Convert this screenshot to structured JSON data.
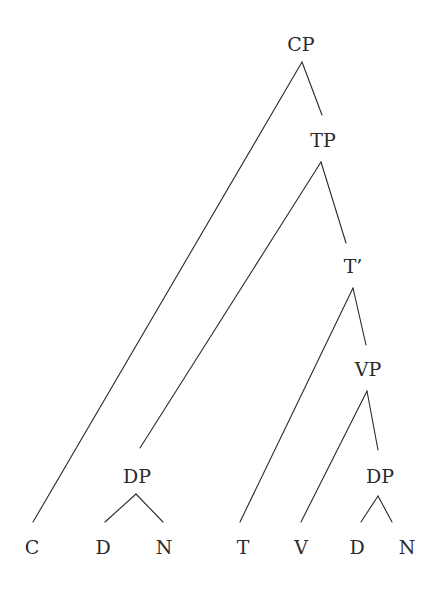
{
  "diagram": {
    "type": "syntax-tree",
    "nodes": {
      "cp": {
        "label": "CP",
        "x": 301,
        "y": 50
      },
      "tp": {
        "label": "TP",
        "x": 323,
        "y": 146
      },
      "tbar": {
        "label": "T’",
        "x": 353,
        "y": 272
      },
      "vp": {
        "label": "VP",
        "x": 368,
        "y": 375
      },
      "dp_subject": {
        "label": "DP",
        "x": 137,
        "y": 482
      },
      "dp_object": {
        "label": "DP",
        "x": 380,
        "y": 482
      },
      "c": {
        "label": "C",
        "x": 32,
        "y": 553
      },
      "d_subject": {
        "label": "D",
        "x": 103,
        "y": 553
      },
      "n_subject": {
        "label": "N",
        "x": 164,
        "y": 553
      },
      "t": {
        "label": "T",
        "x": 243,
        "y": 553
      },
      "v": {
        "label": "V",
        "x": 301,
        "y": 553
      },
      "d_object": {
        "label": "D",
        "x": 357,
        "y": 553
      },
      "n_object": {
        "label": "N",
        "x": 407,
        "y": 553
      }
    },
    "edges": [
      {
        "from": "cp",
        "to": "c",
        "x1": 302,
        "y1": 62,
        "x2": 33,
        "y2": 522
      },
      {
        "from": "cp",
        "to": "tp",
        "x1": 302,
        "y1": 62,
        "x2": 322,
        "y2": 115
      },
      {
        "from": "tp",
        "to": "dp_subject",
        "x1": 321,
        "y1": 162,
        "x2": 140,
        "y2": 448
      },
      {
        "from": "tp",
        "to": "tbar",
        "x1": 321,
        "y1": 162,
        "x2": 346,
        "y2": 243
      },
      {
        "from": "tbar",
        "to": "t",
        "x1": 353,
        "y1": 288,
        "x2": 240,
        "y2": 522
      },
      {
        "from": "tbar",
        "to": "vp",
        "x1": 353,
        "y1": 288,
        "x2": 366,
        "y2": 345
      },
      {
        "from": "vp",
        "to": "v",
        "x1": 367,
        "y1": 391,
        "x2": 301,
        "y2": 522
      },
      {
        "from": "vp",
        "to": "dp_object",
        "x1": 367,
        "y1": 391,
        "x2": 378,
        "y2": 450
      },
      {
        "from": "dp_subject",
        "to": "d_subject",
        "x1": 136,
        "y1": 494,
        "x2": 105,
        "y2": 522
      },
      {
        "from": "dp_subject",
        "to": "n_subject",
        "x1": 136,
        "y1": 494,
        "x2": 163,
        "y2": 522
      },
      {
        "from": "dp_object",
        "to": "d_object",
        "x1": 378,
        "y1": 496,
        "x2": 361,
        "y2": 522
      },
      {
        "from": "dp_object",
        "to": "n_object",
        "x1": 378,
        "y1": 496,
        "x2": 392,
        "y2": 522
      }
    ]
  }
}
